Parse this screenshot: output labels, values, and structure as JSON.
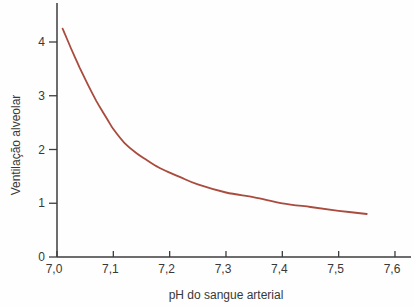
{
  "figure": {
    "background": "#fefefe",
    "axis_color": "#3d3d3d",
    "text_color": "#383838"
  },
  "chart_data": {
    "type": "line",
    "title": "",
    "xlabel": "pH do sangue arterial",
    "ylabel": "Ventilação alveolar",
    "x_ticks": [
      "7,0",
      "7,1",
      "7,2",
      "7,3",
      "7,4",
      "7,5",
      "7,6"
    ],
    "x_tick_values": [
      7.0,
      7.1,
      7.2,
      7.3,
      7.4,
      7.5,
      7.6
    ],
    "y_ticks": [
      "0",
      "1",
      "2",
      "3",
      "4"
    ],
    "y_tick_values": [
      0,
      1,
      2,
      3,
      4
    ],
    "xlim": [
      7.0,
      7.63
    ],
    "ylim": [
      0,
      4.72
    ],
    "grid": false,
    "legend": false,
    "series": [
      {
        "name": "ventilacao-alveolar-curve",
        "color": "#a94b3d",
        "points": [
          [
            7.01,
            4.25
          ],
          [
            7.02,
            4.0
          ],
          [
            7.03,
            3.76
          ],
          [
            7.04,
            3.53
          ],
          [
            7.05,
            3.31
          ],
          [
            7.06,
            3.1
          ],
          [
            7.07,
            2.9
          ],
          [
            7.08,
            2.72
          ],
          [
            7.09,
            2.55
          ],
          [
            7.1,
            2.38
          ],
          [
            7.12,
            2.12
          ],
          [
            7.14,
            1.94
          ],
          [
            7.16,
            1.8
          ],
          [
            7.18,
            1.67
          ],
          [
            7.2,
            1.57
          ],
          [
            7.22,
            1.48
          ],
          [
            7.25,
            1.35
          ],
          [
            7.3,
            1.2
          ],
          [
            7.35,
            1.11
          ],
          [
            7.4,
            1.0
          ],
          [
            7.45,
            0.93
          ],
          [
            7.5,
            0.86
          ],
          [
            7.55,
            0.8
          ]
        ]
      }
    ]
  }
}
